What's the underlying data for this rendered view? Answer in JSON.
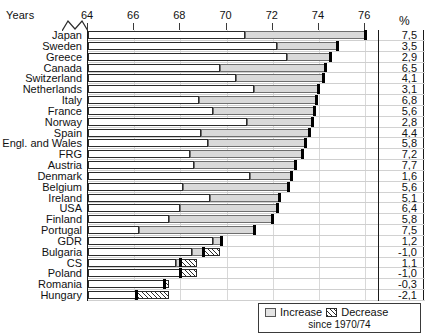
{
  "header": {
    "years_label": "Years",
    "percent_label": "%"
  },
  "legend": {
    "increase_label": "Increase",
    "decrease_label": "Decrease",
    "subtitle": "since 1970/74",
    "increase_icon": "light-stippled-swatch",
    "decrease_icon": "hatched-swatch"
  },
  "chart_data": {
    "type": "bar",
    "orientation": "horizontal",
    "title": "",
    "xlabel": "Years",
    "ylabel": "",
    "xlim": [
      64,
      76.6
    ],
    "x_ticks": [
      64,
      66,
      68,
      70,
      72,
      74,
      76
    ],
    "x_tick_labels": [
      "64",
      "66",
      "68",
      "70",
      "72",
      "74",
      "76"
    ],
    "grid": true,
    "axis_break": true,
    "value_column_header": "%",
    "value_column_note": "change since 1970/74 in percent",
    "categories": [
      "Japan",
      "Sweden",
      "Greece",
      "Canada",
      "Switzerland",
      "Netherlands",
      "Italy",
      "France",
      "Norway",
      "Spain",
      "Engl. and Wales",
      "FRG",
      "Austria",
      "Denmark",
      "Belgium",
      "Ireland",
      "USA",
      "Finland",
      "Portugal",
      "GDR",
      "Bulgaria",
      "CS",
      "Poland",
      "Romania",
      "Hungary"
    ],
    "series": [
      {
        "name": "Base (1970/74 level)",
        "note": "white segment from axis start to start of change segment",
        "values": [
          70.8,
          72.2,
          72.6,
          69.7,
          70.4,
          71.2,
          68.8,
          69.4,
          70.9,
          68.9,
          69.2,
          68.4,
          68.6,
          71.0,
          68.1,
          69.3,
          68.0,
          67.5,
          66.2,
          69.4,
          68.5,
          67.8,
          68.0,
          67.3,
          66.1
        ]
      },
      {
        "name": "Increase",
        "note": "stippled segment, end = current life expectancy",
        "values": [
          76.0,
          74.8,
          74.5,
          74.3,
          74.2,
          74.0,
          73.9,
          73.8,
          73.7,
          73.6,
          73.4,
          73.3,
          73.0,
          72.8,
          72.7,
          72.3,
          72.2,
          72.0,
          71.2,
          69.8,
          69.0,
          68.0,
          68.0,
          67.3,
          66.1
        ]
      },
      {
        "name": "Decrease",
        "note": "hatched segment extending right of bar end cap; empty where no decrease",
        "values": [
          null,
          null,
          null,
          null,
          null,
          null,
          null,
          null,
          null,
          null,
          null,
          null,
          null,
          null,
          null,
          null,
          null,
          null,
          null,
          null,
          69.7,
          68.7,
          68.7,
          67.5,
          67.5
        ]
      }
    ],
    "data_labels": [
      "7,5",
      "3,5",
      "2,9",
      "6,5",
      "4,1",
      "3,1",
      "6,8",
      "5,6",
      "2,8",
      "4,4",
      "5,8",
      "7,2",
      "7,7",
      "1,6",
      "5,6",
      "5,1",
      "6,4",
      "5,8",
      "7,5",
      "1,2",
      "-1,0",
      "1,1",
      "-1,0",
      "-0,3",
      "-2,1"
    ]
  }
}
